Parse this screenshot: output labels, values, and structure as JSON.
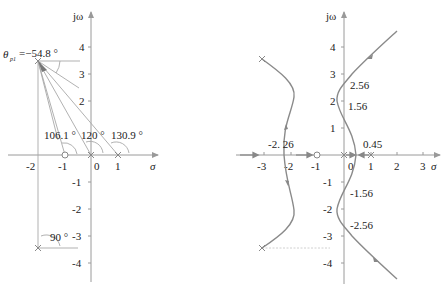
{
  "left_plot": {
    "y_axis_label": "jω",
    "x_axis_label": "σ",
    "x_ticks": [
      "-2",
      "-1",
      "0",
      "1"
    ],
    "y_ticks": [
      "4",
      "3",
      "2",
      "-1",
      "-2",
      "-3",
      "-4"
    ],
    "departure_angle_label": "θ",
    "departure_angle_subscript": "p1",
    "departure_angle_value": "=−54.8 °",
    "angle_labels": [
      "106.1 °",
      "120 °",
      "130.9 °",
      "90 °"
    ],
    "poles": [
      {
        "re": -2,
        "im": 3.5
      },
      {
        "re": -2,
        "im": -3.5
      },
      {
        "re": 0,
        "im": 0
      },
      {
        "re": 1,
        "im": 0
      }
    ],
    "zeros": [
      {
        "re": -1,
        "im": 0
      }
    ]
  },
  "right_plot": {
    "y_axis_label": "jω",
    "x_axis_label": "σ",
    "x_ticks": [
      "-3",
      "-2",
      "-1",
      "0",
      "1",
      "2",
      "3"
    ],
    "y_ticks": [
      "4",
      "3",
      "2",
      "1",
      "-1",
      "-2",
      "-3",
      "-4"
    ],
    "annotations": [
      "2.56",
      "1.56",
      "-2. 26",
      "0.45",
      "-1.56",
      "-2.56"
    ],
    "poles": [
      {
        "re": -2,
        "im": 3.5
      },
      {
        "re": -2,
        "im": -3.5
      },
      {
        "re": 0,
        "im": 0
      },
      {
        "re": 1,
        "im": 0
      }
    ],
    "zeros": [
      {
        "re": -1,
        "im": 0
      }
    ],
    "breakaway_point": 0.45,
    "real_axis_crossing": -2.26,
    "imag_axis_crossings": [
      2.56,
      1.56,
      -1.56,
      -2.56
    ]
  },
  "colors": {
    "axis": "#9a9a9a",
    "locus": "#8a8a8a",
    "text": "#222222"
  }
}
